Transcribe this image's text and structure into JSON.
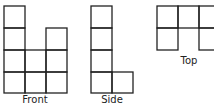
{
  "figure": {
    "views": [
      {
        "name": "front",
        "label": "Front",
        "column_heights": [
          4,
          2,
          3
        ]
      },
      {
        "name": "side",
        "label": "Side",
        "column_heights": [
          4,
          1
        ]
      },
      {
        "name": "top",
        "label": "Top",
        "grid": [
          [
            1,
            1,
            1
          ],
          [
            1,
            0,
            1
          ]
        ]
      }
    ],
    "stroke_color": "#222222",
    "background": "#ffffff"
  }
}
